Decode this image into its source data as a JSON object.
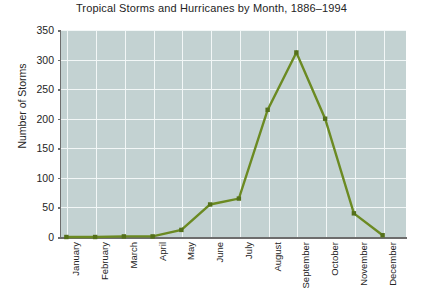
{
  "chart_data": {
    "type": "line",
    "title": "Tropical Storms and Hurricanes by Month, 1886–1994",
    "xlabel": "",
    "ylabel": "Number of Storms",
    "categories": [
      "January",
      "February",
      "March",
      "April",
      "May",
      "June",
      "July",
      "August",
      "September",
      "October",
      "November",
      "December"
    ],
    "values": [
      0,
      0,
      1,
      1,
      12,
      55,
      65,
      215,
      312,
      200,
      40,
      3
    ],
    "series": [
      {
        "name": "Number of Storms",
        "values": [
          0,
          0,
          1,
          1,
          12,
          55,
          65,
          215,
          312,
          200,
          40,
          3
        ]
      }
    ],
    "ylim": [
      0,
      350
    ],
    "yticks": [
      0,
      50,
      100,
      150,
      200,
      250,
      300,
      350
    ],
    "ytick_labels": [
      "0",
      "50",
      "100",
      "150",
      "200",
      "250",
      "300",
      "350"
    ],
    "grid": true,
    "legend": "none",
    "markers": true,
    "colors": {
      "line": "#6b8a22",
      "marker": "#54701a",
      "plot_background": "#c3d2d2",
      "gridline": "#f2f7f7",
      "axis": "#6d6d6d",
      "text": "#242424",
      "page_background": "#ffffff"
    }
  }
}
